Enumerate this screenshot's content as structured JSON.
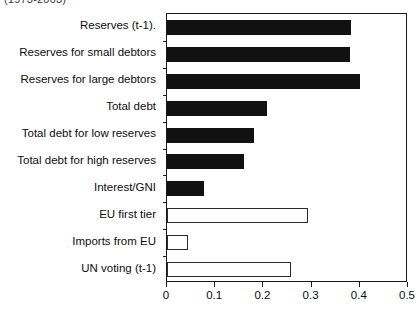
{
  "caption_fragment": "(1973-2003)",
  "chart_data": {
    "type": "bar",
    "orientation": "horizontal",
    "title": "",
    "subtitle": "",
    "xlabel": "",
    "ylabel": "",
    "xlim": [
      0,
      0.5
    ],
    "xticks": [
      0,
      0.1,
      0.2,
      0.3,
      0.4,
      0.5
    ],
    "xtick_labels": [
      "0",
      "0.1",
      "0.2",
      "0.3",
      "0.4",
      "0.5"
    ],
    "grid": false,
    "legend": false,
    "categories": [
      "Reserves (t-1).",
      "Reserves for small debtors",
      "Reserves for large debtors",
      "Total debt",
      "Total debt for low reserves",
      "Total debt for high reserves",
      "Interest/GNI",
      "EU first tier",
      "Imports from EU",
      "UN voting (t-1)"
    ],
    "values": [
      0.382,
      0.38,
      0.4,
      0.208,
      0.181,
      0.16,
      0.077,
      0.292,
      0.043,
      0.257
    ],
    "bar_styles": [
      "filled",
      "filled",
      "filled",
      "filled",
      "filled",
      "filled",
      "filled",
      "hollow",
      "hollow",
      "hollow"
    ],
    "colors": {
      "filled_fill": "#111111",
      "filled_edge": "#111111",
      "hollow_fill": "#ffffff",
      "hollow_edge": "#2b2b2b",
      "axis": "#1a1a1a",
      "text": "#0d0d0d",
      "background": "#ffffff"
    }
  }
}
